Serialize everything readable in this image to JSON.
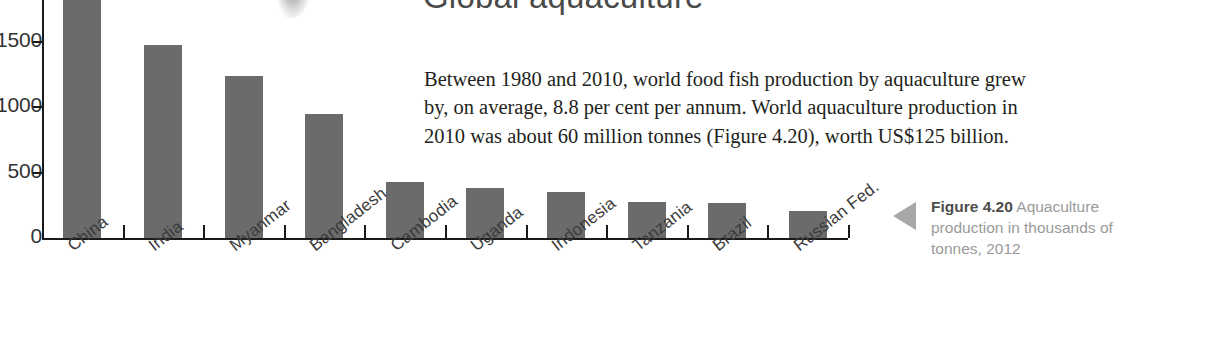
{
  "heading": "Global aquaculture",
  "body_text": "Between 1980 and 2010, world food fish production by aquaculture grew by, on average, 8.8 per cent per annum. World aquaculture production in 2010 was about 60 million tonnes (Figure 4.20), worth US$125 billion.",
  "caption": {
    "label": "Figure 4.20",
    "text": " Aquaculture production in thousands of tonnes, 2012",
    "arrow_icon": "triangle-left-icon",
    "arrow_color": "#a8a8a8"
  },
  "chart_data": {
    "type": "bar",
    "title": "",
    "xlabel": "",
    "ylabel": "",
    "categories": [
      "China",
      "India",
      "Myanmar",
      "Bangladesh",
      "Cambodia",
      "Uganda",
      "Indonesia",
      "Tanzania",
      "Brazil",
      "Russian Fed."
    ],
    "values": [
      4500,
      1470,
      1235,
      945,
      425,
      385,
      350,
      275,
      270,
      210
    ],
    "ylim": [
      0,
      1700
    ],
    "yticks": [
      0,
      500,
      1000,
      1500
    ],
    "ytick_labels": [
      "0",
      "500",
      "1000",
      "1500"
    ],
    "grid": false,
    "legend": false,
    "bar_color": "#6b6b6b",
    "axis_color": "#1a1a1a",
    "note": "First bar (China) extends above the top of the cropped view"
  }
}
